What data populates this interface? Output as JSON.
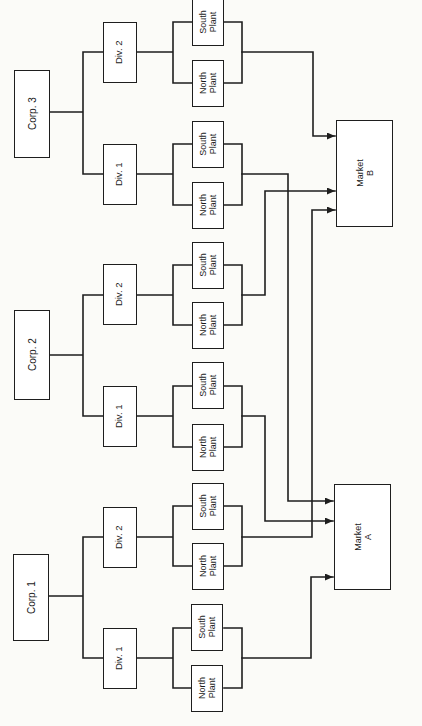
{
  "corporations": [
    {
      "label": "Corp. 1",
      "divisions": [
        {
          "label": "Div. 1",
          "plants": [
            {
              "label": "North\nPlant"
            },
            {
              "label": "South\nPlant"
            }
          ],
          "supplies": "Market A"
        },
        {
          "label": "Div. 2",
          "plants": [
            {
              "label": "North\nPlant"
            },
            {
              "label": "South\nPlant"
            }
          ],
          "supplies": "Market B"
        }
      ]
    },
    {
      "label": "Corp. 2",
      "divisions": [
        {
          "label": "Div. 1",
          "plants": [
            {
              "label": "North\nPlant"
            },
            {
              "label": "South\nPlant"
            }
          ],
          "supplies": "Market A"
        },
        {
          "label": "Div. 2",
          "plants": [
            {
              "label": "North\nPlant"
            },
            {
              "label": "South\nPlant"
            }
          ],
          "supplies": "Market B"
        }
      ]
    },
    {
      "label": "Corp. 3",
      "divisions": [
        {
          "label": "Div. 1",
          "plants": [
            {
              "label": "North\nPlant"
            },
            {
              "label": "South\nPlant"
            }
          ],
          "supplies": "Market A"
        },
        {
          "label": "Div. 2",
          "plants": [
            {
              "label": "North\nPlant"
            },
            {
              "label": "South\nPlant"
            }
          ],
          "supplies": "Market B"
        }
      ]
    }
  ],
  "markets": [
    {
      "label": "Market\nA"
    },
    {
      "label": "Market\nB"
    }
  ],
  "colors": {
    "line": "#1e1e1e",
    "background": "#fbfbf8",
    "box_fill": "#ffffff"
  }
}
